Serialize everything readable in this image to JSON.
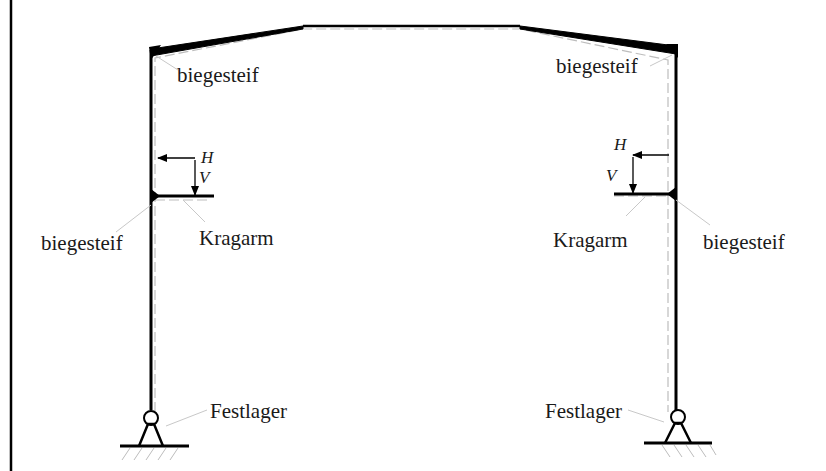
{
  "diagram": {
    "colors": {
      "member": "#000000",
      "dashed_line": "#bdbdbd",
      "leader_line": "#c8c8c8",
      "hatch": "#bdbdbd",
      "text": "#1a1a1a"
    },
    "labels": {
      "top_left_joint": "biegesteif",
      "top_right_joint": "biegesteif",
      "left_bracket_joint": "biegesteif",
      "right_bracket_joint": "biegesteif",
      "left_cantilever": "Kragarm",
      "right_cantilever": "Kragarm",
      "left_support": "Festlager",
      "right_support": "Festlager"
    },
    "loads": {
      "left": {
        "horizontal": "H",
        "vertical": "V"
      },
      "right": {
        "horizontal": "H",
        "vertical": "V"
      }
    }
  }
}
